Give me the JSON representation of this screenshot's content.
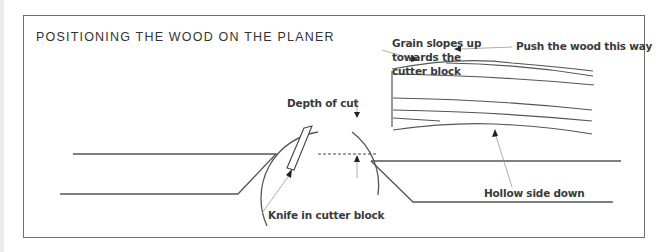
{
  "figure": {
    "title": "POSITIONING THE WOOD ON THE PLANER",
    "annotations": {
      "grain": [
        "Grain slopes up",
        "towards the",
        "cutter block"
      ],
      "push": "Push the wood this way",
      "depth": "Depth of cut",
      "knife": "Knife in cutter block",
      "hollow": "Hollow side down"
    },
    "components": [
      "infeed table",
      "cutter block",
      "knife",
      "outfeed table",
      "workpiece with grain lines"
    ],
    "colors": {
      "line": "#444444",
      "frame": "#6f6f6f",
      "text": "#3a3a3a",
      "leader": "#9a9a9a"
    }
  }
}
